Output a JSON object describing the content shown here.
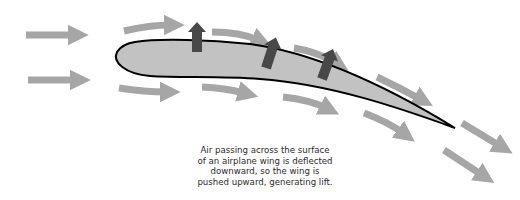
{
  "diagram": {
    "caption_lines": [
      "Air passing across the surface",
      "of an airplane wing is deflected",
      "downward, so the wing is",
      "pushed upward, generating lift."
    ],
    "colors": {
      "background": "#ffffff",
      "airflow_arrow": "#a6a6a6",
      "lift_arrow": "#484848",
      "wing_fill": "#c2c2c2",
      "wing_outline": "#000000",
      "caption_text": "#2a2a2a"
    },
    "elements": {
      "wing": "airfoil cross-section",
      "airflow_arrows": "light gray curved arrows showing air deflected downward",
      "lift_arrows": "dark gray arrows pointing upward from the wing surface"
    }
  }
}
